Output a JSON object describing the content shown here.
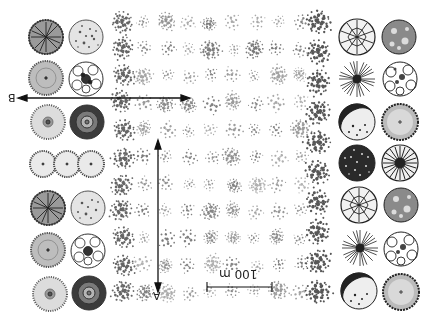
{
  "figure": {
    "orientation": "rotated-180",
    "background": "#ffffff",
    "ink_color": "#2a2a2a",
    "labels": {
      "section_a": "A",
      "section_b": "B",
      "scale": "100 m"
    },
    "left_symbols": [
      {
        "row": 0,
        "items": [
          "dense-radial-canopy",
          "stippled-canopy"
        ]
      },
      {
        "row": 1,
        "items": [
          "stippled-radial-canopy",
          "lobed-cloud-canopy"
        ]
      },
      {
        "row": 2,
        "items": [
          "ring-dot-canopy",
          "dense-ring-canopy"
        ]
      },
      {
        "row": 3,
        "items": [
          "hedge-triple-canopy"
        ]
      },
      {
        "row": 4,
        "items": [
          "dense-radial-canopy",
          "stippled-canopy"
        ]
      },
      {
        "row": 5,
        "items": [
          "stippled-radial-canopy",
          "lobed-cloud-canopy"
        ]
      },
      {
        "row": 6,
        "items": [
          "ring-dot-canopy",
          "dense-ring-canopy"
        ]
      }
    ],
    "right_symbols": [
      {
        "row": 0,
        "items": [
          "segmented-radial-canopy",
          "mottled-canopy"
        ]
      },
      {
        "row": 1,
        "items": [
          "starburst-canopy",
          "lobed-outline-canopy"
        ]
      },
      {
        "row": 2,
        "items": [
          "crescent-shade-canopy",
          "scalloped-ring-canopy"
        ]
      },
      {
        "row": 3,
        "items": [
          "dark-stippled-canopy",
          "striped-radial-canopy"
        ]
      },
      {
        "row": 4,
        "items": [
          "segmented-radial-canopy",
          "mottled-canopy"
        ]
      },
      {
        "row": 5,
        "items": [
          "starburst-canopy",
          "lobed-outline-canopy"
        ]
      },
      {
        "row": 6,
        "items": [
          "crescent-shade-canopy",
          "scalloped-ring-canopy"
        ]
      }
    ],
    "plantation_grid": {
      "rows": 11,
      "columns": 9,
      "x_start": 122,
      "x_end": 300,
      "y_start": 22,
      "y_end": 292,
      "edge_column_x": 318
    },
    "section_line_b": {
      "x1": 18,
      "y1": 98,
      "x2": 188,
      "y2": 98
    },
    "section_line_a": {
      "x1": 158,
      "y1": 140,
      "x2": 158,
      "y2": 292
    },
    "scale_bar": {
      "x1": 207,
      "x2": 272,
      "y": 287
    }
  }
}
